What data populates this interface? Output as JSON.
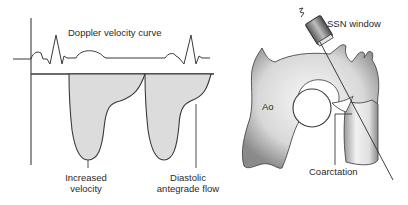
{
  "diagram": {
    "doppler": {
      "title": "Doppler velocity curve",
      "labels": {
        "increased_velocity": [
          "Increased",
          "velocity"
        ],
        "diastolic_flow": [
          "Diastolic",
          "antegrade flow"
        ]
      }
    },
    "anatomy": {
      "probe_label": "SSN window",
      "aorta_label": "Ao",
      "coarctation_label": "Coarctation"
    },
    "colors": {
      "line": "#3a3a3a",
      "fill": "#dcdcdc",
      "vessel_dark": "#7a7a7a",
      "vessel_light": "#f4f4f4"
    }
  }
}
